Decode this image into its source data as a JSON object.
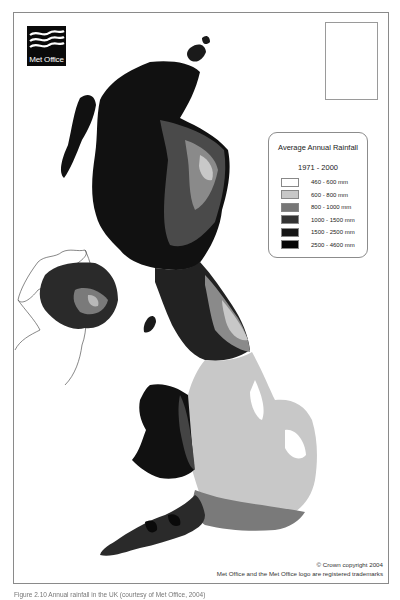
{
  "logo": {
    "text": "Met Office",
    "icon": "met-office-waves-icon"
  },
  "legend": {
    "title": "Average Annual Rainfall",
    "period": "1971 - 2000",
    "items": [
      {
        "label": "460 - 600 mm",
        "color": "#ffffff"
      },
      {
        "label": "600 - 800 mm",
        "color": "#c8c8c8"
      },
      {
        "label": "800 - 1000 mm",
        "color": "#777777"
      },
      {
        "label": "1000 - 1500 mm",
        "color": "#333333"
      },
      {
        "label": "1500 - 2500 mm",
        "color": "#161616"
      },
      {
        "label": "2500 - 4600 mm",
        "color": "#050505"
      }
    ]
  },
  "inset": {
    "label": "Shetland Islands inset"
  },
  "footer": {
    "copyright": "© Crown copyright 2004",
    "trademark": "Met Office and the Met Office logo are registered trademarks"
  },
  "caption": "Figure 2.10  Annual rainfall in the UK (courtesy of Met Office, 2004)"
}
